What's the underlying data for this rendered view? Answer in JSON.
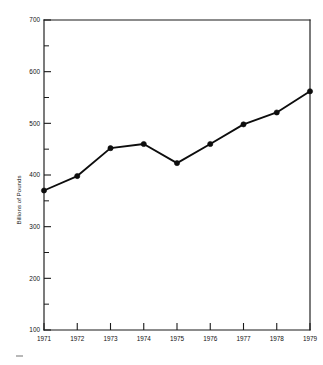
{
  "chart_data": {
    "type": "line",
    "title": "",
    "subtitle": "",
    "xlabel": "",
    "ylabel": "Billions of Pounds",
    "categories": [
      "1971",
      "1972",
      "1973",
      "1974",
      "1975",
      "1976",
      "1977",
      "1978",
      "1979"
    ],
    "x": [
      1971,
      1972,
      1973,
      1974,
      1975,
      1976,
      1977,
      1978,
      1979
    ],
    "values": [
      370,
      398,
      452,
      460,
      423,
      460,
      498,
      521,
      562
    ],
    "series": [
      {
        "name": "Billions of Pounds",
        "values": [
          370,
          398,
          452,
          460,
          423,
          460,
          498,
          521,
          562
        ]
      }
    ],
    "xlim": [
      1971,
      1979
    ],
    "ylim": [
      100,
      700
    ],
    "y_ticks_major": [
      100,
      200,
      300,
      400,
      500,
      600,
      700
    ],
    "y_ticks_minor": [
      150,
      250,
      350,
      450,
      550,
      650
    ],
    "y_tick_labels": [
      "100",
      "200",
      "300",
      "400",
      "500",
      "600",
      "700"
    ],
    "x_tick_labels": [
      "1971",
      "1972",
      "1973",
      "1974",
      "1975",
      "1976",
      "1977",
      "1978",
      "1979"
    ],
    "grid": false,
    "legend": false,
    "legend_position": "none",
    "marker": "filled-circle",
    "line_color": "#0d0d0d",
    "marker_color": "#0d0d0d",
    "axis_color": "#1a1a1a",
    "background_color": "#ffffff",
    "annotations": []
  },
  "figure": {
    "caption": ""
  }
}
